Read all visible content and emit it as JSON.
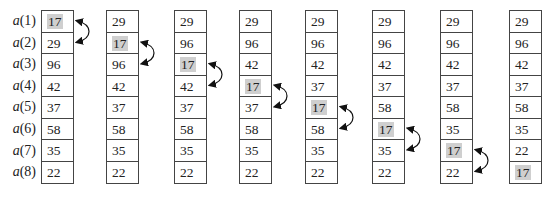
{
  "diagram": {
    "type": "bubble-sort-pass-illustration",
    "row_labels": [
      "a(1)",
      "a(2)",
      "a(3)",
      "a(4)",
      "a(5)",
      "a(6)",
      "a(7)",
      "a(8)"
    ],
    "highlight_value": "17",
    "highlight_color": "#cfcfcf",
    "columns": [
      {
        "values": [
          "17",
          "29",
          "96",
          "42",
          "37",
          "58",
          "35",
          "22"
        ],
        "highlight_index": 0,
        "swap": [
          0,
          1
        ]
      },
      {
        "values": [
          "29",
          "17",
          "96",
          "42",
          "37",
          "58",
          "35",
          "22"
        ],
        "highlight_index": 1,
        "swap": [
          1,
          2
        ]
      },
      {
        "values": [
          "29",
          "96",
          "17",
          "42",
          "37",
          "58",
          "35",
          "22"
        ],
        "highlight_index": 2,
        "swap": [
          2,
          3
        ]
      },
      {
        "values": [
          "29",
          "96",
          "42",
          "17",
          "37",
          "58",
          "35",
          "22"
        ],
        "highlight_index": 3,
        "swap": [
          3,
          4
        ]
      },
      {
        "values": [
          "29",
          "96",
          "42",
          "37",
          "17",
          "58",
          "35",
          "22"
        ],
        "highlight_index": 4,
        "swap": [
          4,
          5
        ]
      },
      {
        "values": [
          "29",
          "96",
          "42",
          "37",
          "58",
          "17",
          "35",
          "22"
        ],
        "highlight_index": 5,
        "swap": [
          5,
          6
        ]
      },
      {
        "values": [
          "29",
          "96",
          "42",
          "37",
          "58",
          "35",
          "17",
          "22"
        ],
        "highlight_index": 6,
        "swap": [
          6,
          7
        ]
      },
      {
        "values": [
          "29",
          "96",
          "42",
          "37",
          "58",
          "35",
          "22",
          "17"
        ],
        "highlight_index": 7,
        "swap": null
      }
    ]
  }
}
